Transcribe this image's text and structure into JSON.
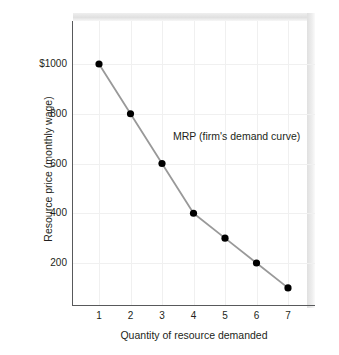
{
  "chart_data": {
    "type": "line",
    "title": "",
    "subtitle": "",
    "xlabel": "Quantity of resource demanded",
    "ylabel": "Resource price (monthly wage)",
    "x": [
      1,
      2,
      3,
      4,
      5,
      6,
      7
    ],
    "xtick_labels": [
      "1",
      "2",
      "3",
      "4",
      "5",
      "6",
      "7"
    ],
    "ytick_values": [
      200,
      400,
      600,
      800,
      1000
    ],
    "ytick_labels": [
      "200",
      "400",
      "600",
      "800",
      "$1000"
    ],
    "xlim": [
      0.35,
      7.7
    ],
    "ylim": [
      0,
      1140
    ],
    "grid": true,
    "legend_position": "none",
    "series": [
      {
        "name": "MRP (firm's demand curve)",
        "values": [
          1000,
          800,
          600,
          400,
          300,
          200,
          100
        ],
        "line_color": "#999999",
        "marker_color": "#000000",
        "marker": "circle"
      }
    ],
    "annotations": [
      {
        "text": "MRP (firm's demand curve)",
        "x": 3.35,
        "y": 710
      }
    ],
    "colors": {
      "axis": "#58595b",
      "grid": "#f0f0f0",
      "text": "#231f20",
      "background": "#ffffff",
      "shadow": "#e3e3e3"
    }
  }
}
